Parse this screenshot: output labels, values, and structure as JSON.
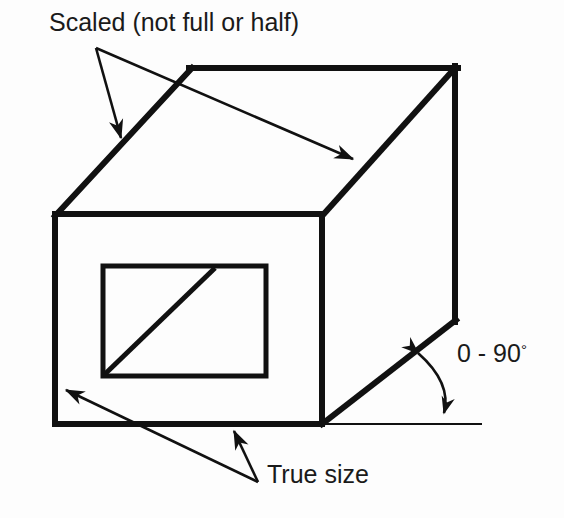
{
  "figure": {
    "type": "oblique-projection-box-diagram",
    "background_color": "#fdfdfd",
    "stroke_color": "#111111",
    "text_color": "#1a1a1a"
  },
  "annotations": {
    "scaled_label": "Scaled (not full or half)",
    "true_size_label": "True size",
    "angle_label_value": "0 - 90",
    "angle_label_degree_symbol": "°"
  },
  "geometry": {
    "front_face": {
      "label": "front-face-rectangle",
      "left": 55,
      "top": 214,
      "right": 322,
      "bottom": 424,
      "stroke_width": 6
    },
    "inner_rectangle": {
      "label": "inner-detail-rectangle",
      "left": 103,
      "top": 266,
      "right": 266,
      "bottom": 376,
      "stroke_width": 5
    },
    "inner_diagonal": {
      "label": "inner-diagonal-line",
      "x1": 105,
      "y1": 374,
      "x2": 215,
      "y2": 268,
      "stroke_width": 5
    },
    "top_edge": {
      "label": "top-back-horizontal-edge",
      "x1": 192,
      "y1": 68,
      "x2": 455,
      "y2": 68,
      "stroke_width": 6
    },
    "receding_edge_top_left": {
      "label": "receding-edge-top-left",
      "x1": 55,
      "y1": 214,
      "x2": 192,
      "y2": 68,
      "stroke_width": 6
    },
    "receding_edge_top_right": {
      "label": "receding-edge-top-right",
      "x1": 322,
      "y1": 214,
      "x2": 455,
      "y2": 68,
      "stroke_width": 6
    },
    "right_back_edge": {
      "label": "right-back-vertical-edge",
      "x1": 455,
      "y1": 68,
      "x2": 455,
      "y2": 320,
      "stroke_width": 6
    },
    "receding_edge_bottom_right": {
      "label": "receding-edge-bottom-right",
      "x1": 322,
      "y1": 424,
      "x2": 455,
      "y2": 320,
      "stroke_width": 6
    },
    "ground_reference_line": {
      "label": "horizontal-reference-line",
      "x1": 322,
      "y1": 424,
      "x2": 482,
      "y2": 424,
      "stroke_width": 2
    }
  },
  "leaders": {
    "scaled_origin": {
      "x": 96,
      "y": 48
    },
    "scaled_arrow_1_target": {
      "x": 121,
      "y": 142
    },
    "scaled_arrow_2_target": {
      "x": 357,
      "y": 161
    },
    "true_size_origin": {
      "x": 258,
      "y": 482
    },
    "true_size_arrow_1_target": {
      "x": 62,
      "y": 388
    },
    "true_size_arrow_2_target": {
      "x": 232,
      "y": 428
    },
    "angle_arc": {
      "label": "angle-arc-double-arrow",
      "center_x": 322,
      "center_y": 424,
      "radius": 120,
      "start_angle_deg": 38,
      "end_angle_deg": 0
    }
  }
}
